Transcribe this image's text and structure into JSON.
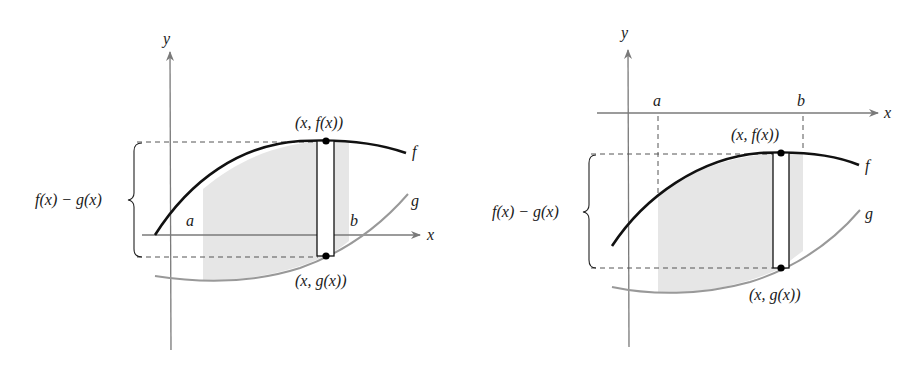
{
  "figure": {
    "colors": {
      "f_curve": "#111111",
      "g_curve": "#999999",
      "axes": "#7a7a7a",
      "shade": "#e6e6e6",
      "dashed": "#555555"
    },
    "panels": [
      {
        "id": "left",
        "axis_labels": {
          "x": "x",
          "y": "y"
        },
        "interval_labels": {
          "a": "a",
          "b": "b"
        },
        "curve_labels": {
          "f": "f",
          "g": "g"
        },
        "point_top": "(x, f(x))",
        "point_bottom": "(x, g(x))",
        "height_label": "f(x) − g(x)"
      },
      {
        "id": "right",
        "axis_labels": {
          "x": "x",
          "y": "y"
        },
        "interval_labels": {
          "a": "a",
          "b": "b"
        },
        "curve_labels": {
          "f": "f",
          "g": "g"
        },
        "point_top": "(x, f(x))",
        "point_bottom": "(x, g(x))",
        "height_label": "f(x) − g(x)"
      }
    ]
  }
}
